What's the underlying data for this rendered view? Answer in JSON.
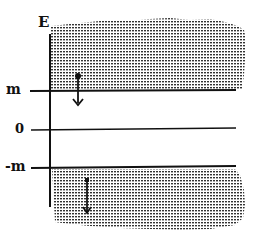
{
  "diagram": {
    "axis_label": "E",
    "levels": [
      {
        "id": "m",
        "label": "m"
      },
      {
        "id": "zero",
        "label": "0"
      },
      {
        "id": "neg_m",
        "label": "-m"
      }
    ],
    "regions": [
      {
        "name": "upper-continuum",
        "fill": "dotted",
        "description": "filled region above m"
      },
      {
        "name": "lower-continuum",
        "fill": "dotted",
        "description": "filled region below -m"
      }
    ],
    "arrows": [
      {
        "name": "upper-transition-arrow",
        "direction": "down",
        "from_region": "upper-continuum"
      },
      {
        "name": "lower-transition-arrow",
        "direction": "both",
        "from_region": "lower-continuum"
      }
    ],
    "colors": {
      "ink": "#111111",
      "shade": "#555555",
      "background": "#ffffff"
    }
  }
}
